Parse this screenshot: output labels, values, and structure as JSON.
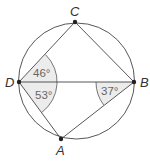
{
  "figure": {
    "type": "inscribed quadrilateral in circle",
    "circle": {
      "cx": 76.5,
      "cy": 81,
      "r": 58
    },
    "colors": {
      "stroke": "#444444",
      "shade": "#ececec",
      "point": "#222222"
    },
    "points": {
      "C": {
        "label": "C",
        "x": 75,
        "y": 22
      },
      "D": {
        "label": "D",
        "x": 19,
        "y": 82
      },
      "B": {
        "label": "B",
        "x": 134,
        "y": 82
      },
      "A": {
        "label": "A",
        "x": 61,
        "y": 139
      }
    },
    "segments": [
      "CD",
      "CB",
      "DB",
      "DA",
      "AB"
    ],
    "angles": [
      {
        "vertex": "D",
        "between": "CD-DB",
        "label": "46°"
      },
      {
        "vertex": "D",
        "between": "DB-DA",
        "label": "53°"
      },
      {
        "vertex": "B",
        "between": "DB-BA",
        "label": "37°"
      }
    ]
  }
}
